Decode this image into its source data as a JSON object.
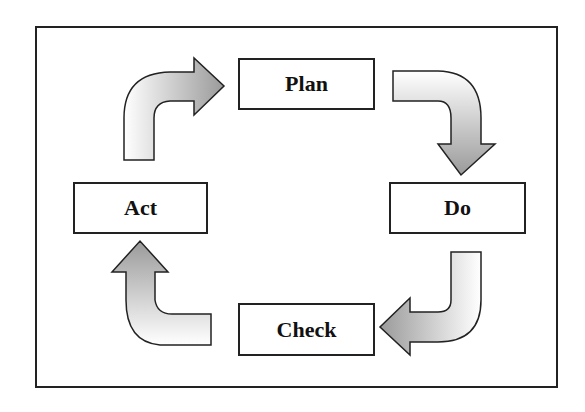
{
  "diagram": {
    "nodes": [
      {
        "id": "plan",
        "label": "Plan"
      },
      {
        "id": "do",
        "label": "Do"
      },
      {
        "id": "check",
        "label": "Check"
      },
      {
        "id": "act",
        "label": "Act"
      }
    ],
    "edges": [
      {
        "from": "plan",
        "to": "do"
      },
      {
        "from": "do",
        "to": "check"
      },
      {
        "from": "check",
        "to": "act"
      },
      {
        "from": "act",
        "to": "plan"
      }
    ],
    "colors": {
      "border": "#222222",
      "arrow_light": "#ffffff",
      "arrow_dark": "#9a9a9a"
    }
  }
}
